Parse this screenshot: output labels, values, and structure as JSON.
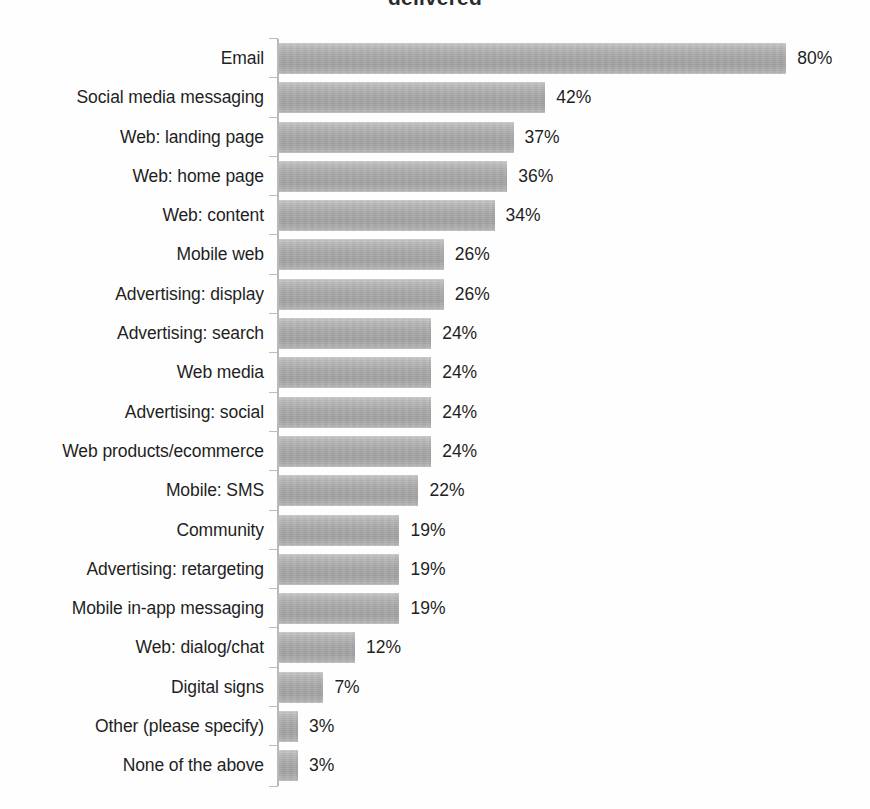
{
  "chart_data": {
    "type": "bar",
    "orientation": "horizontal",
    "title": "delivered",
    "title_clipped": true,
    "xlabel": "",
    "ylabel": "",
    "xlim": [
      0,
      80
    ],
    "grid": false,
    "legend": "none",
    "value_suffix": "%",
    "categories": [
      "Email",
      "Social media messaging",
      "Web: landing page",
      "Web: home page",
      "Web: content",
      "Mobile web",
      "Advertising: display",
      "Advertising: search",
      "Web media",
      "Advertising: social",
      "Web products/ecommerce",
      "Mobile: SMS",
      "Community",
      "Advertising: retargeting",
      "Mobile in-app messaging",
      "Web: dialog/chat",
      "Digital signs",
      "Other (please specify)",
      "None of the above"
    ],
    "values": [
      80,
      42,
      37,
      36,
      34,
      26,
      26,
      24,
      24,
      24,
      24,
      22,
      19,
      19,
      19,
      12,
      7,
      3,
      3
    ],
    "value_labels": [
      "80%",
      "42%",
      "37%",
      "36%",
      "34%",
      "26%",
      "26%",
      "24%",
      "24%",
      "24%",
      "24%",
      "22%",
      "19%",
      "19%",
      "19%",
      "12%",
      "7%",
      "3%",
      "3%"
    ],
    "bar_color": "#aaaaaa",
    "axis_color": "#b9b9b9",
    "text_color": "#1f1f1f"
  }
}
